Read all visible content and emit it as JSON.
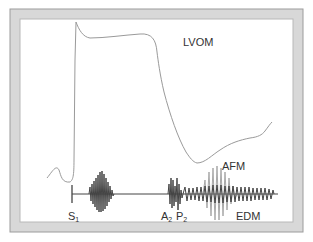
{
  "figure": {
    "frame_color": "#d4d4d4",
    "frame_edge_color": "#9a9a9a",
    "line_color": "#9a9a9a",
    "wave_color": "#444444",
    "labels": {
      "lvom": "LVOM",
      "afm": "AFM",
      "s1": "S",
      "s1_sub": "1",
      "a2": "A",
      "a2_sub": "2",
      "p2": "P",
      "p2_sub": "2",
      "edm": "EDM"
    }
  }
}
